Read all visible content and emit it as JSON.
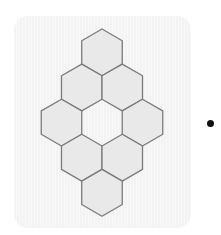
{
  "figure": {
    "hex_radius": 23.4,
    "hex_fill": "#e9e9e9",
    "hex_stroke": "#7b7b7b",
    "panel_color": "#f5f5f5",
    "hexagons": [
      {
        "row": 0,
        "cx": 102,
        "cy": 52.4
      },
      {
        "row": 1,
        "cx": 81.75,
        "cy": 87.5
      },
      {
        "row": 1,
        "cx": 122.25,
        "cy": 87.5
      },
      {
        "row": 2,
        "cx": 61.5,
        "cy": 122.6
      },
      {
        "row": 2,
        "cx": 142.5,
        "cy": 122.6
      },
      {
        "row": 3,
        "cx": 81.75,
        "cy": 157.7
      },
      {
        "row": 3,
        "cx": 122.25,
        "cy": 157.7
      },
      {
        "row": 4,
        "cx": 102,
        "cy": 192.8
      }
    ],
    "empty_cell": {
      "cx": 102,
      "cy": 122.6
    },
    "bullet": {
      "cx": 210,
      "cy": 123,
      "color": "#111111"
    }
  }
}
